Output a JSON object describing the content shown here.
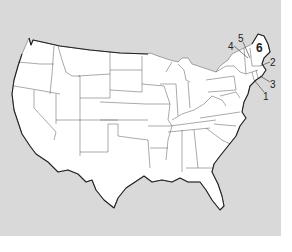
{
  "map": {
    "title": "",
    "subject": "Contiguous United States outline map",
    "background_color": "#d9d9d9",
    "land_color": "#ffffff",
    "border_color": "#555555",
    "labels": [
      {
        "id": "1",
        "text": "1",
        "state": "Connecticut"
      },
      {
        "id": "2",
        "text": "2",
        "state": "Massachusetts"
      },
      {
        "id": "3",
        "text": "3",
        "state": "Rhode Island"
      },
      {
        "id": "4",
        "text": "4",
        "state": "Vermont"
      },
      {
        "id": "5",
        "text": "5",
        "state": "New Hampshire"
      },
      {
        "id": "6",
        "text": "6",
        "state": "Maine"
      }
    ]
  }
}
